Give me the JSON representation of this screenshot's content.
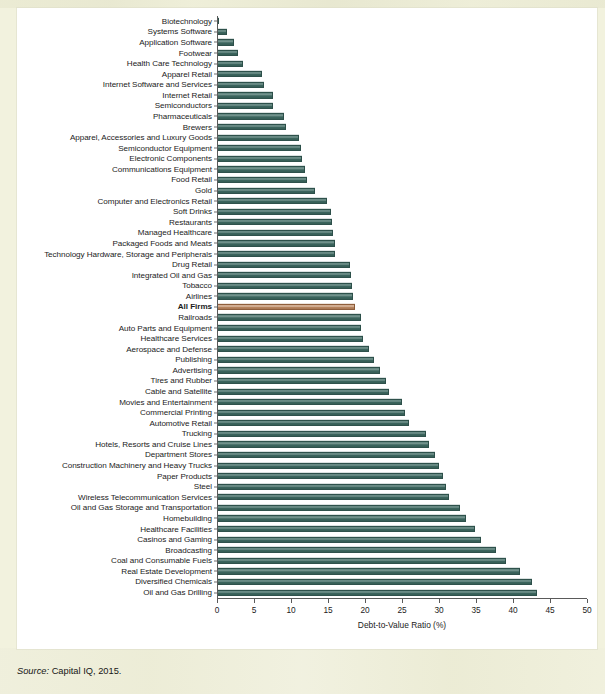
{
  "source": {
    "prefix": "Source:",
    "text": " Capital IQ, 2015."
  },
  "colors": {
    "bar": "#3f6b63",
    "highlight_bar": "#c08a62",
    "panel_background": "#ffffff",
    "page_background": "#f2f2de",
    "axis": "#5a5a5a"
  },
  "chart_data": {
    "type": "bar",
    "orientation": "horizontal",
    "title": "",
    "subtitle": "",
    "xlabel": "Debt-to-Value Ratio (%)",
    "ylabel": "",
    "xlim": [
      0,
      50
    ],
    "xticks": [
      0,
      5,
      10,
      15,
      20,
      25,
      30,
      35,
      40,
      45,
      50
    ],
    "xtick_labels": [
      "0",
      "5",
      "10",
      "15",
      "20",
      "25",
      "30",
      "35",
      "40",
      "45",
      "50"
    ],
    "grid": false,
    "legend": "none",
    "highlight_category": "All Firms",
    "categories": [
      "Biotechnology",
      "Systems Software",
      "Application Software",
      "Footwear",
      "Health Care Technology",
      "Apparel Retail",
      "Internet Software and Services",
      "Internet Retail",
      "Semiconductors",
      "Pharmaceuticals",
      "Brewers",
      "Apparel, Accessories and Luxury Goods",
      "Semiconductor Equipment",
      "Electronic Components",
      "Communications Equipment",
      "Food Retail",
      "Gold",
      "Computer and Electronics Retail",
      "Soft Drinks",
      "Restaurants",
      "Managed Healthcare",
      "Packaged Foods and Meats",
      "Technology Hardware, Storage and Peripherals",
      "Drug Retail",
      "Integrated Oil and Gas",
      "Tobacco",
      "Airlines",
      "All Firms",
      "Railroads",
      "Auto Parts and Equipment",
      "Healthcare Services",
      "Aerospace and Defense",
      "Publishing",
      "Advertising",
      "Tires and Rubber",
      "Cable and Satellite",
      "Movies and Entertainment",
      "Commercial Printing",
      "Automotive Retail",
      "Trucking",
      "Hotels, Resorts and Cruise Lines",
      "Department Stores",
      "Construction Machinery and Heavy Trucks",
      "Paper Products",
      "Steel",
      "Wireless Telecommunication Services",
      "Oil and Gas Storage and Transportation",
      "Homebuilding",
      "Healthcare Facilities",
      "Casinos and Gaming",
      "Broadcasting",
      "Coal and Consumable Fuels",
      "Real Estate Development",
      "Diversified Chemicals",
      "Oil and Gas Drilling"
    ],
    "values": [
      0.3,
      1.4,
      2.3,
      2.9,
      3.5,
      6.1,
      6.3,
      7.5,
      7.6,
      9.1,
      9.3,
      11.1,
      11.3,
      11.5,
      11.9,
      12.2,
      13.3,
      14.8,
      15.4,
      15.5,
      15.7,
      15.9,
      16.0,
      18.0,
      18.1,
      18.2,
      18.4,
      18.6,
      19.4,
      19.5,
      19.7,
      20.5,
      21.2,
      22.0,
      22.8,
      23.2,
      25.0,
      25.4,
      26.0,
      28.2,
      28.6,
      29.4,
      30.0,
      30.6,
      31.0,
      31.4,
      32.8,
      33.6,
      34.8,
      35.7,
      37.7,
      39.1,
      41.0,
      42.6,
      43.2
    ]
  }
}
